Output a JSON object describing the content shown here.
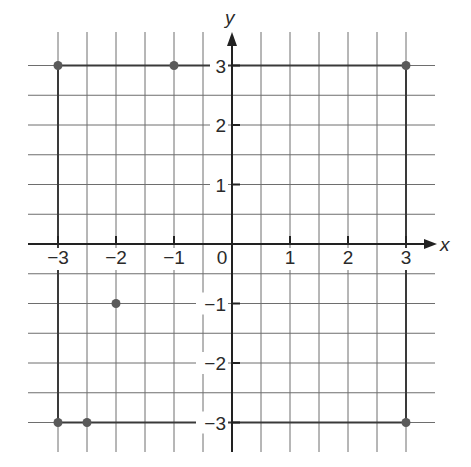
{
  "diagram": {
    "type": "coordinate-plane",
    "axis_labels": {
      "x": "x",
      "y": "y"
    },
    "x_ticks": [
      {
        "value": -3,
        "label": "−3"
      },
      {
        "value": -2,
        "label": "−2"
      },
      {
        "value": -1,
        "label": "−1"
      },
      {
        "value": 0,
        "label": "0"
      },
      {
        "value": 1,
        "label": "1"
      },
      {
        "value": 2,
        "label": "2"
      },
      {
        "value": 3,
        "label": "3"
      }
    ],
    "y_ticks": [
      {
        "value": 3,
        "label": "3"
      },
      {
        "value": 2,
        "label": "2"
      },
      {
        "value": 1,
        "label": "1"
      },
      {
        "value": -1,
        "label": "−1"
      },
      {
        "value": -2,
        "label": "−2"
      },
      {
        "value": -3,
        "label": "−3"
      }
    ],
    "grid_step": 0.5,
    "range": {
      "x": [
        -3,
        3
      ],
      "y": [
        -3,
        3
      ]
    },
    "points": [
      {
        "x": -3,
        "y": 3
      },
      {
        "x": -1,
        "y": 3
      },
      {
        "x": 3,
        "y": 3
      },
      {
        "x": -2,
        "y": -1
      },
      {
        "x": -3,
        "y": -3
      },
      {
        "x": -2.5,
        "y": -3
      },
      {
        "x": 3,
        "y": -3
      }
    ],
    "segments": [
      {
        "from": [
          -3,
          3
        ],
        "to": [
          3,
          3
        ]
      },
      {
        "from": [
          -3,
          3
        ],
        "to": [
          -3,
          -3
        ]
      },
      {
        "from": [
          -3,
          -3
        ],
        "to": [
          3,
          -3
        ]
      },
      {
        "from": [
          3,
          3
        ],
        "to": [
          3,
          -3
        ]
      }
    ],
    "colors": {
      "grid": "#6e6e6e",
      "axis": "#222222",
      "point": "#5a5a5a",
      "segment": "#3a3a3a"
    }
  }
}
